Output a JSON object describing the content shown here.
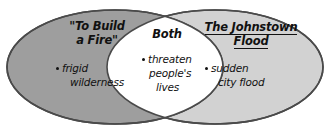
{
  "diagram": {
    "type": "venn",
    "title": "",
    "background_color": "#ffffff",
    "outline_color": "#3d3d3d",
    "text_color": "#111111",
    "left": {
      "name": "left-circle",
      "fill_color": "#9e9e9e",
      "title_line1": "\"To Build",
      "title_line2": "a Fire\"",
      "title_underlined": false,
      "items": [
        {
          "line1": "frigid",
          "line2": "wilderness"
        }
      ]
    },
    "center": {
      "name": "overlap-region",
      "fill_color": "#ffffff",
      "title": "Both",
      "title_underlined": false,
      "items": [
        {
          "line1": "threaten",
          "line2": "people's",
          "line3": "lives"
        }
      ]
    },
    "right": {
      "name": "right-circle",
      "fill_color": "#d2d2d2",
      "title_line1": "The Johnstown",
      "title_line2": "Flood",
      "title_underlined": true,
      "items": [
        {
          "line1": "sudden",
          "line2": "city flood"
        }
      ]
    }
  }
}
